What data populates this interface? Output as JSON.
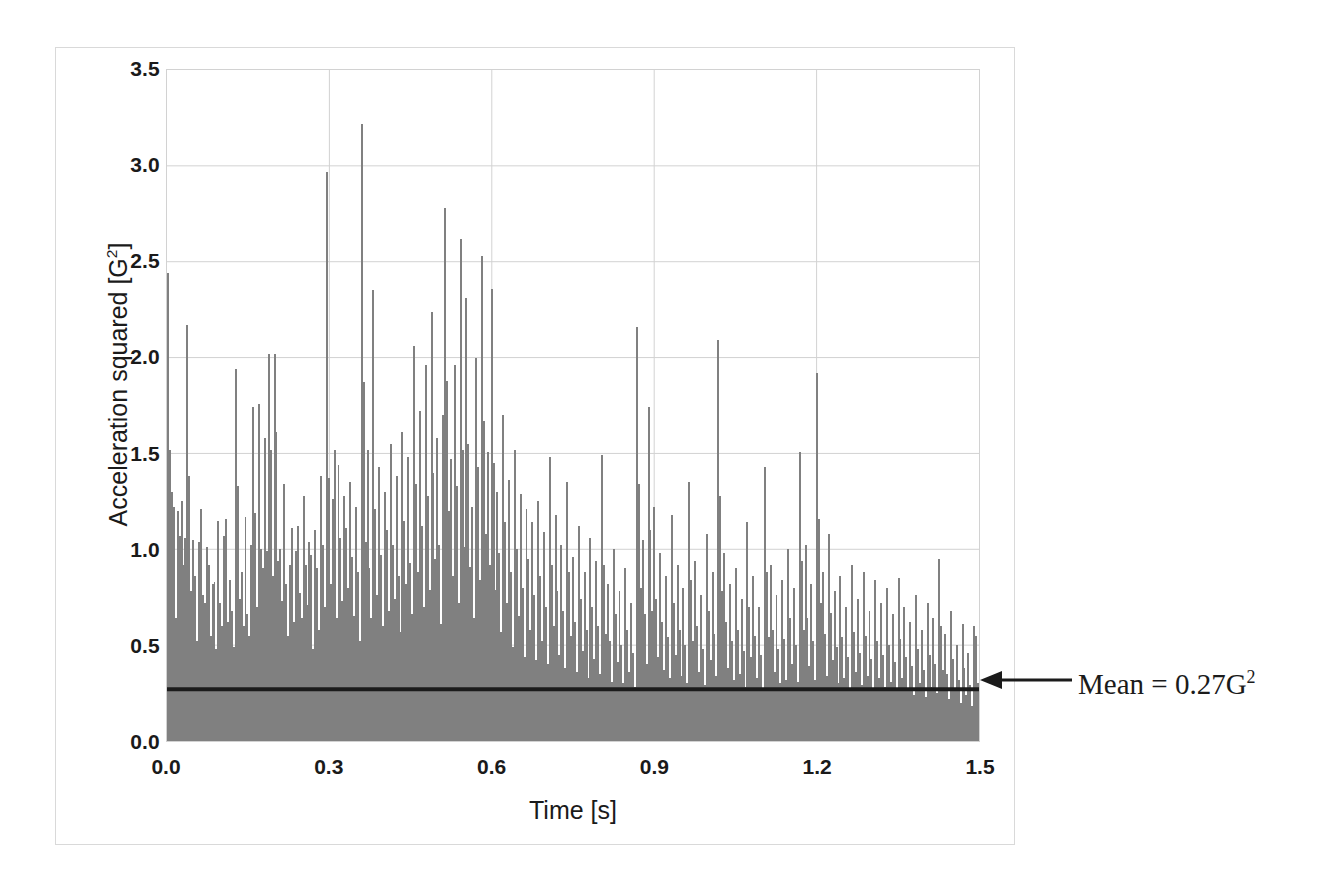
{
  "chart_data": {
    "type": "bar",
    "title": "",
    "subtitle": "",
    "xlabel": "Time [s]",
    "ylabel": "Acceleration squared [G²]",
    "ylabel_text": "Acceleration squared [G",
    "ylabel_exponent": "2",
    "ylabel_tail": "]",
    "xlabel_text": "Time [s]",
    "xlim": [
      0.0,
      1.5
    ],
    "ylim": [
      0.0,
      3.5
    ],
    "grid": true,
    "legend": false,
    "legend_position": "none",
    "series_name": "Acceleration squared",
    "bar_color": "#808080",
    "gridline_color": "#d2d2d2",
    "axis_text_color": "#1a1a1a",
    "xticks": [
      "0.0",
      "0.3",
      "0.6",
      "0.9",
      "1.2",
      "1.5"
    ],
    "xtick_values": [
      0.0,
      0.3,
      0.6,
      0.9,
      1.2,
      1.5
    ],
    "yticks": [
      "0.0",
      "0.5",
      "1.0",
      "1.5",
      "2.0",
      "2.5",
      "3.0",
      "3.5"
    ],
    "ytick_values": [
      0.0,
      0.5,
      1.0,
      1.5,
      2.0,
      2.5,
      3.0,
      3.5
    ],
    "annotations": [
      {
        "name": "mean-line",
        "label_prefix": "Mean = ",
        "label_value": "0.27",
        "label_unit": "G",
        "label_exponent": "2",
        "full_text": "Mean = 0.27G²",
        "value": 0.27,
        "line_color": "#1b1b1b",
        "arrow": "left"
      }
    ],
    "x_step": 0.003,
    "values": [
      2.44,
      1.52,
      1.3,
      1.22,
      0.64,
      1.2,
      1.07,
      1.25,
      0.92,
      1.06,
      2.17,
      1.38,
      0.78,
      1.05,
      0.86,
      0.52,
      1.04,
      1.21,
      0.76,
      0.72,
      1.01,
      0.92,
      0.55,
      0.82,
      0.83,
      0.48,
      1.15,
      0.72,
      0.6,
      1.07,
      1.16,
      0.62,
      0.84,
      0.68,
      0.49,
      1.94,
      1.33,
      0.74,
      0.88,
      0.6,
      1.17,
      0.66,
      0.55,
      1.02,
      1.74,
      1.19,
      0.7,
      1.76,
      1.0,
      0.9,
      1.58,
      0.99,
      2.02,
      1.52,
      0.86,
      2.02,
      1.61,
      0.94,
      1.0,
      0.73,
      1.34,
      0.82,
      0.55,
      0.92,
      1.11,
      0.62,
      0.99,
      1.12,
      0.77,
      0.64,
      1.28,
      0.92,
      0.71,
      1.04,
      0.97,
      0.48,
      1.1,
      0.9,
      0.58,
      1.38,
      1.02,
      0.7,
      2.97,
      1.37,
      0.82,
      1.26,
      1.52,
      0.64,
      1.44,
      1.06,
      0.73,
      1.28,
      1.11,
      0.8,
      1.35,
      0.96,
      0.65,
      1.22,
      0.88,
      0.52,
      3.22,
      1.87,
      1.04,
      1.52,
      0.9,
      0.64,
      2.35,
      1.21,
      0.76,
      1.43,
      0.97,
      0.6,
      1.3,
      1.1,
      0.68,
      1.55,
      1.02,
      0.74,
      1.38,
      0.86,
      0.57,
      1.61,
      1.15,
      0.82,
      1.48,
      0.93,
      0.66,
      2.06,
      1.34,
      0.88,
      1.72,
      1.12,
      0.7,
      1.96,
      1.28,
      0.79,
      2.24,
      1.4,
      0.95,
      1.58,
      1.02,
      0.61,
      1.7,
      2.78,
      1.88,
      1.2,
      1.47,
      0.86,
      1.96,
      1.33,
      0.72,
      2.62,
      1.52,
      1.01,
      2.31,
      1.55,
      0.91,
      1.22,
      0.64,
      2.0,
      1.43,
      0.84,
      2.53,
      1.67,
      1.08,
      1.51,
      0.92,
      2.36,
      1.45,
      0.79,
      1.3,
      0.98,
      0.57,
      1.7,
      1.14,
      0.72,
      1.36,
      0.88,
      0.49,
      1.52,
      1.0,
      0.65,
      1.29,
      0.8,
      0.44,
      1.21,
      0.95,
      0.58,
      1.14,
      0.76,
      0.42,
      1.25,
      0.86,
      0.52,
      1.09,
      0.7,
      0.4,
      1.48,
      0.92,
      0.6,
      1.18,
      0.78,
      0.45,
      1.02,
      0.68,
      0.38,
      1.35,
      0.88,
      0.55,
      0.96,
      0.62,
      0.36,
      1.12,
      0.74,
      0.47,
      0.88,
      0.58,
      0.33,
      1.06,
      0.7,
      0.43,
      0.94,
      0.6,
      0.35,
      1.49,
      0.92,
      0.56,
      0.82,
      0.52,
      0.31,
      1.0,
      0.66,
      0.41,
      0.78,
      0.5,
      0.3,
      0.9,
      0.58,
      0.36,
      0.72,
      0.46,
      0.28,
      2.16,
      1.34,
      0.8,
      1.05,
      0.66,
      0.4,
      1.74,
      1.1,
      0.68,
      1.22,
      0.74,
      0.44,
      0.98,
      0.62,
      0.37,
      0.86,
      0.54,
      0.33,
      1.18,
      0.72,
      0.45,
      0.92,
      0.58,
      0.34,
      0.8,
      0.5,
      0.3,
      1.35,
      0.84,
      0.52,
      0.94,
      0.6,
      0.36,
      0.76,
      0.48,
      0.29,
      1.08,
      0.68,
      0.42,
      0.88,
      0.56,
      0.34,
      2.09,
      1.28,
      0.78,
      0.98,
      0.62,
      0.38,
      0.82,
      0.52,
      0.32,
      0.9,
      0.58,
      0.35,
      0.74,
      0.47,
      0.28,
      1.14,
      0.7,
      0.44,
      0.86,
      0.55,
      0.33,
      0.7,
      0.45,
      0.27,
      1.43,
      0.88,
      0.54,
      0.92,
      0.58,
      0.36,
      0.76,
      0.48,
      0.3,
      0.84,
      0.53,
      0.32,
      1.0,
      0.64,
      0.4,
      0.8,
      0.5,
      0.31,
      1.51,
      0.94,
      0.58,
      1.02,
      0.64,
      0.39,
      0.82,
      0.52,
      0.32,
      1.92,
      1.16,
      0.72,
      0.88,
      0.56,
      0.34,
      1.08,
      0.67,
      0.42,
      0.78,
      0.49,
      0.3,
      0.86,
      0.54,
      0.33,
      0.7,
      0.44,
      0.27,
      0.92,
      0.57,
      0.36,
      0.74,
      0.46,
      0.29,
      0.88,
      0.55,
      0.34,
      0.68,
      0.43,
      0.26,
      0.84,
      0.52,
      0.33,
      0.72,
      0.45,
      0.28,
      0.8,
      0.5,
      0.31,
      0.66,
      0.41,
      0.26,
      0.85,
      0.53,
      0.33,
      0.7,
      0.44,
      0.27,
      0.62,
      0.39,
      0.24,
      0.76,
      0.48,
      0.3,
      0.58,
      0.37,
      0.23,
      0.72,
      0.45,
      0.28,
      0.64,
      0.4,
      0.25,
      0.95,
      0.6,
      0.37,
      0.56,
      0.35,
      0.22,
      0.68,
      0.43,
      0.27,
      0.5,
      0.32,
      0.2,
      0.61,
      0.38,
      0.24,
      0.46,
      0.29,
      0.18,
      0.6,
      0.55,
      0.3
    ]
  }
}
